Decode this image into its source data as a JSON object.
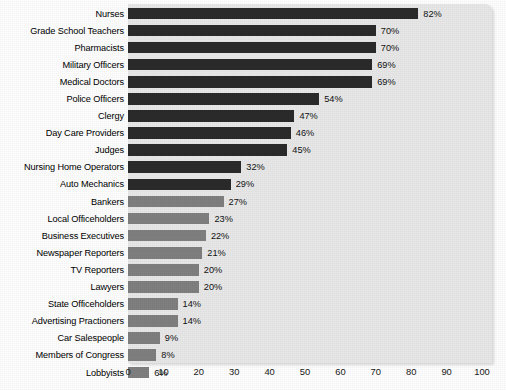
{
  "chart_data": {
    "type": "bar",
    "orientation": "horizontal",
    "title": "",
    "subtitle": "",
    "xlabel": "",
    "ylabel": "",
    "xlim": [
      0,
      100
    ],
    "xticks": [
      "0",
      "10",
      "20",
      "30",
      "40",
      "50",
      "60",
      "70",
      "80",
      "90",
      "100"
    ],
    "xtick_values": [
      0,
      10,
      20,
      30,
      40,
      50,
      60,
      70,
      80,
      90,
      100
    ],
    "grid": false,
    "legend": "none",
    "value_suffix": "%",
    "colors": {
      "bar_high": "#2b2b2b",
      "bar_low": "#808080",
      "panel_background": "#e9e9e9",
      "page_background": "#ffffff",
      "text": "#000000"
    },
    "categories": [
      "Nurses",
      "Grade School Teachers",
      "Pharmacists",
      "Military Officers",
      "Medical Doctors",
      "Police Officers",
      "Clergy",
      "Day Care Providers",
      "Judges",
      "Nursing Home Operators",
      "Auto Mechanics",
      "Bankers",
      "Local Officeholders",
      "Business Executives",
      "Newspaper Reporters",
      "TV Reporters",
      "Lawyers",
      "State Officeholders",
      "Advertising Practioners",
      "Car Salespeople",
      "Members of Congress",
      "Lobbyists"
    ],
    "values": [
      82,
      70,
      70,
      69,
      69,
      54,
      47,
      46,
      45,
      32,
      29,
      27,
      23,
      22,
      21,
      20,
      20,
      14,
      14,
      9,
      8,
      6
    ],
    "value_labels": [
      "82%",
      "70%",
      "70%",
      "69%",
      "69%",
      "54%",
      "47%",
      "46%",
      "45%",
      "32%",
      "29%",
      "27%",
      "23%",
      "22%",
      "21%",
      "20%",
      "20%",
      "14%",
      "14%",
      "9%",
      "8%",
      "6%"
    ],
    "bar_shades": [
      "dark",
      "dark",
      "dark",
      "dark",
      "dark",
      "dark",
      "dark",
      "dark",
      "dark",
      "dark",
      "dark",
      "light",
      "light",
      "light",
      "light",
      "light",
      "light",
      "light",
      "light",
      "light",
      "light",
      "light"
    ]
  }
}
